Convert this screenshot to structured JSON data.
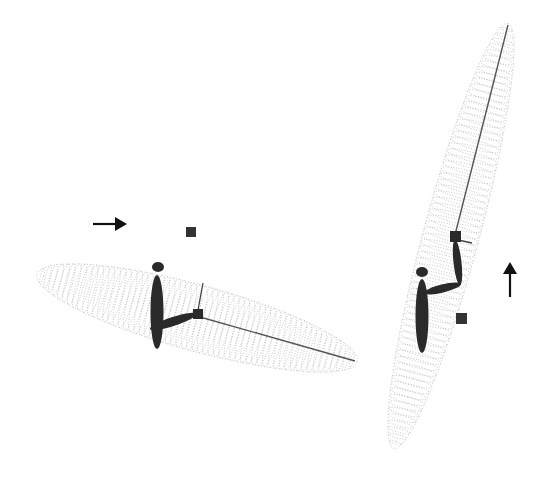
{
  "figure": {
    "background": "#ffffff",
    "ink_color": "#2a2a2a",
    "trace_color": "#8a8a8a",
    "panels": [
      {
        "id": "left",
        "direction_arrow": {
          "icon": "arrow-right-icon",
          "x1": 93,
          "y1": 224,
          "x2": 127,
          "y2": 224
        },
        "target_square": {
          "x": 186,
          "y": 227,
          "size": 10
        },
        "workspace_trace": {
          "cx": 197,
          "cy": 318,
          "rx": 166,
          "ry": 33,
          "angle": 15.3,
          "rings": 60
        },
        "arm": {
          "head": {
            "cx": 158,
            "cy": 267,
            "rx": 6,
            "ry": 5
          },
          "body": {
            "cx": 157,
            "cy": 312,
            "rx": 6.5,
            "ry": 37,
            "angle": 0
          },
          "upper_arm": {
            "x1": 150,
            "y1": 329,
            "x2": 196,
            "y2": 314,
            "width": 9
          },
          "end_cube": {
            "x": 193,
            "y": 309,
            "size": 10
          },
          "rod": {
            "x1": 198,
            "y1": 310,
            "x2": 203,
            "y2": 283
          },
          "link_line": {
            "x1": 200,
            "y1": 317,
            "x2": 355,
            "y2": 361
          }
        }
      },
      {
        "id": "right",
        "direction_arrow": {
          "icon": "arrow-up-icon",
          "x1": 510,
          "y1": 297,
          "x2": 510,
          "y2": 262
        },
        "target_square": {
          "x": 456,
          "y": 313,
          "size": 11
        },
        "workspace_trace": {
          "cx": 451,
          "cy": 236,
          "rx": 220,
          "ry": 28,
          "angle": -75,
          "rings": 70
        },
        "arm": {
          "head": {
            "cx": 422,
            "cy": 272,
            "rx": 6,
            "ry": 5
          },
          "body": {
            "cx": 422,
            "cy": 316,
            "rx": 6.5,
            "ry": 37,
            "angle": 0
          },
          "upper_arm": {
            "x1": 424,
            "y1": 293,
            "x2": 461,
            "y2": 284,
            "width": 8
          },
          "forearm": {
            "x1": 460,
            "y1": 285,
            "x2": 455,
            "y2": 240,
            "width": 8
          },
          "end_cube": {
            "x": 450,
            "y": 231,
            "size": 11
          },
          "rod": {
            "x1": 458,
            "y1": 240,
            "x2": 472,
            "y2": 243
          },
          "link_line": {
            "x1": 455,
            "y1": 235,
            "x2": 508,
            "y2": 25
          }
        }
      }
    ]
  }
}
